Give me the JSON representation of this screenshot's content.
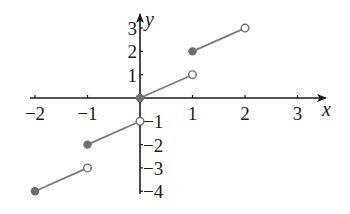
{
  "chart_data": {
    "type": "line",
    "title": "",
    "xlabel": "x",
    "ylabel": "y",
    "xlim": [
      -2,
      3
    ],
    "ylim": [
      -4,
      3
    ],
    "grid": false,
    "legend": null,
    "x_ticks": [
      -2,
      -1,
      1,
      2,
      3
    ],
    "y_ticks_positive": [
      1,
      2,
      3
    ],
    "y_ticks_negative": [
      -1,
      -2,
      -3,
      -4
    ],
    "x_tick_labels": [
      "−2",
      "−1",
      "1",
      "2",
      "3"
    ],
    "y_tick_labels_positive": [
      "1",
      "2",
      "3"
    ],
    "y_tick_labels_negative": [
      "−1",
      "−2",
      "−3",
      "−4"
    ],
    "series": [
      {
        "name": "segment-1",
        "x": [
          -2,
          -1
        ],
        "y": [
          -4,
          -3
        ],
        "start": "closed",
        "end": "open"
      },
      {
        "name": "segment-2",
        "x": [
          -1,
          0
        ],
        "y": [
          -2,
          -1
        ],
        "start": "closed",
        "end": "open"
      },
      {
        "name": "segment-3",
        "x": [
          0,
          1
        ],
        "y": [
          0,
          1
        ],
        "start": "closed",
        "end": "open"
      },
      {
        "name": "segment-4",
        "x": [
          1,
          2
        ],
        "y": [
          2,
          3
        ],
        "start": "closed",
        "end": "open"
      }
    ],
    "colors": {
      "axis": "#1a1a1a",
      "segment": "#7a7a7a",
      "closed_point": "#6e6e6e",
      "open_point_fill": "#ffffff",
      "open_point_stroke": "#6e6e6e"
    }
  }
}
